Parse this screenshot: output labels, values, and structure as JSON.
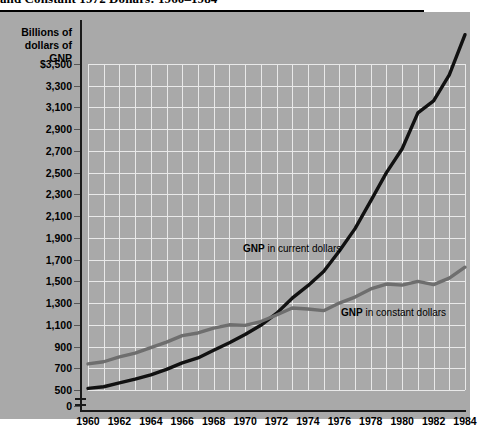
{
  "title": {
    "text": "and Constant 1972 Dollars: 1960–1984",
    "note": "title is cropped at the top edge of the screenshot"
  },
  "axis": {
    "y_caption_line1": "Billions of",
    "y_caption_line2": "dollars of GNP",
    "y_zero_label": "0"
  },
  "notes": {
    "current_bold": "GNP",
    "current_rest": " in current dollars",
    "constant_bold": "GNP",
    "constant_rest": " in constant dollars"
  },
  "colors": {
    "plate": "#a9a9a9",
    "grid": "#e9e9e9",
    "axis": "#1a1a1a",
    "current_series": "#111111",
    "constant_series": "#6e6e6e",
    "page": "#ffffff"
  },
  "chart_data": {
    "type": "line",
    "title": "and Constant 1972 Dollars: 1960–1984",
    "xlabel": "",
    "ylabel": "Billions of dollars of GNP",
    "xlim": [
      1960,
      1984
    ],
    "ylim": [
      500,
      3700
    ],
    "ytick_labels": [
      "$3,500",
      "3,300",
      "3,100",
      "2,900",
      "2,700",
      "2,500",
      "2,300",
      "2,100",
      "1,900",
      "1,700",
      "1,500",
      "1,300",
      "1,100",
      "900",
      "700",
      "500",
      "0"
    ],
    "ytick_values": [
      3500,
      3300,
      3100,
      2900,
      2700,
      2500,
      2300,
      2100,
      1900,
      1700,
      1500,
      1300,
      1100,
      900,
      700,
      500,
      0
    ],
    "xtick_labels": [
      "1960",
      "1962",
      "1964",
      "1966",
      "1968",
      "1970",
      "1972",
      "1974",
      "1976",
      "1978",
      "1980",
      "1982",
      "1984"
    ],
    "xtick_values": [
      1960,
      1962,
      1964,
      1966,
      1968,
      1970,
      1972,
      1974,
      1976,
      1978,
      1980,
      1982,
      1984
    ],
    "grid": true,
    "legend": "inline annotations",
    "x": [
      1960,
      1961,
      1962,
      1963,
      1964,
      1965,
      1966,
      1967,
      1968,
      1969,
      1970,
      1971,
      1972,
      1973,
      1974,
      1975,
      1976,
      1977,
      1978,
      1979,
      1980,
      1981,
      1982,
      1983,
      1984
    ],
    "series": [
      {
        "name": "GNP in current dollars",
        "color": "#111111",
        "values": [
          515,
          530,
          565,
          600,
          640,
          690,
          750,
          795,
          865,
          935,
          1010,
          1095,
          1205,
          1345,
          1460,
          1590,
          1780,
          1985,
          2240,
          2500,
          2720,
          3050,
          3160,
          3400,
          3770
        ]
      },
      {
        "name": "GNP in constant dollars",
        "color": "#6e6e6e",
        "values": [
          740,
          760,
          805,
          840,
          890,
          940,
          1000,
          1025,
          1070,
          1100,
          1095,
          1130,
          1190,
          1255,
          1245,
          1230,
          1300,
          1355,
          1430,
          1475,
          1465,
          1500,
          1470,
          1530,
          1630
        ]
      }
    ],
    "annotations": [
      {
        "text": "GNP in current dollars",
        "x": 1971,
        "y": 1800
      },
      {
        "text": "GNP in constant dollars",
        "x": 1977,
        "y": 1250
      }
    ]
  }
}
